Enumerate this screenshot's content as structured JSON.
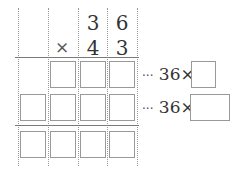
{
  "problem": {
    "multiplicand": [
      "3",
      "6"
    ],
    "multiplier": [
      "4",
      "3"
    ],
    "operator": "×",
    "partial_rows": [
      {
        "boxes": 3,
        "annotation": {
          "prefix": "···",
          "factor": "36",
          "operator": "×",
          "answer_box": "small"
        }
      },
      {
        "boxes": 4,
        "annotation": {
          "prefix": "···",
          "factor": "36",
          "operator": "×",
          "answer_box": "wide"
        }
      }
    ],
    "result_row": {
      "boxes": 4
    }
  },
  "colors": {
    "grid_dotted": "#9a9a9a",
    "grid_solid": "#7a7a7a",
    "box_border": "#999999",
    "text": "#333333"
  }
}
